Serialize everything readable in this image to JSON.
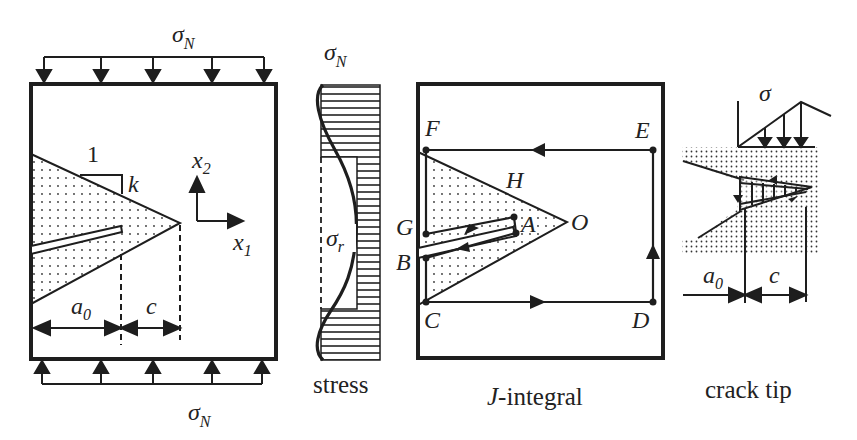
{
  "figure": {
    "panels": [
      {
        "id": "specimen",
        "labels": {
          "top_load": "σ",
          "top_load_sub": "N",
          "bottom_load": "σ",
          "bottom_load_sub": "N",
          "slope_run": "1",
          "slope_rise": "k",
          "axis_x1": "x",
          "axis_x1_sub": "1",
          "axis_x2": "x",
          "axis_x2_sub": "2",
          "dim_a0": "a",
          "dim_a0_sub": "0",
          "dim_c": "c"
        }
      },
      {
        "id": "stress",
        "labels": {
          "top": "σ",
          "top_sub": "N",
          "residual": "σ",
          "residual_sub": "r",
          "caption": "stress"
        }
      },
      {
        "id": "j-integral",
        "labels": {
          "points": [
            "F",
            "E",
            "H",
            "G",
            "A",
            "O",
            "B",
            "C",
            "D"
          ],
          "F": "F",
          "E": "E",
          "H": "H",
          "G": "G",
          "A": "A",
          "O": "O",
          "B": "B",
          "C": "C",
          "D": "D",
          "caption_italic": "J",
          "caption_rest": "-integral"
        }
      },
      {
        "id": "crack-tip",
        "labels": {
          "load": "σ",
          "dim_a0": "a",
          "dim_a0_sub": "0",
          "dim_c": "c",
          "caption": "crack tip"
        }
      }
    ],
    "colors": {
      "ink": "#1e1e1e",
      "background": "#ffffff"
    }
  }
}
